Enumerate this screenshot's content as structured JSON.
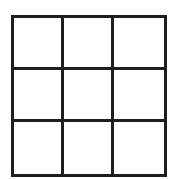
{
  "board": {
    "rows": 3,
    "cols": 3,
    "line_color": "#1e1e1e",
    "cells": [
      "",
      "",
      "",
      "",
      "",
      "",
      "",
      "",
      ""
    ]
  }
}
